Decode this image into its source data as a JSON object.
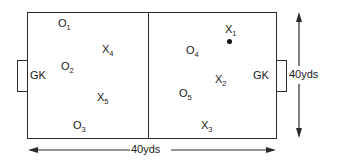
{
  "diagram": {
    "type": "soccer-field-drill",
    "goalkeepers": [
      {
        "label": "GK",
        "side": "left",
        "x": 34,
        "y": 70
      },
      {
        "label": "GK",
        "side": "right",
        "x": 253,
        "y": 70
      }
    ],
    "players_o": [
      {
        "base": "O",
        "sub": "1",
        "x": 58,
        "y": 22
      },
      {
        "base": "O",
        "sub": "2",
        "x": 61,
        "y": 61
      },
      {
        "base": "O",
        "sub": "3",
        "x": 73,
        "y": 120
      },
      {
        "base": "O",
        "sub": "4",
        "x": 186,
        "y": 44
      },
      {
        "base": "O",
        "sub": "5",
        "x": 179,
        "y": 88
      }
    ],
    "players_x": [
      {
        "base": "X",
        "sub": "1",
        "x": 225,
        "y": 24
      },
      {
        "base": "X",
        "sub": "2",
        "x": 214,
        "y": 73
      },
      {
        "base": "X",
        "sub": "3",
        "x": 201,
        "y": 121
      },
      {
        "base": "X",
        "sub": "4",
        "x": 102,
        "y": 43
      },
      {
        "base": "X",
        "sub": "5",
        "x": 97,
        "y": 91
      }
    ],
    "ball": {
      "x": 228,
      "y": 40
    },
    "dimensions": {
      "width_label": "40yds",
      "height_label": "40yds"
    }
  }
}
